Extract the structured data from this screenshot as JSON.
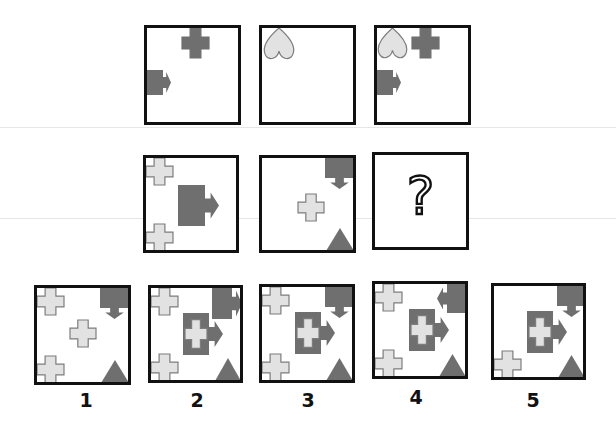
{
  "puzzle": {
    "colors": {
      "dark_fill": "#6f6f6f",
      "light_fill": "#e2e2e2",
      "light_stroke": "#7d7d7d",
      "border": "#111111"
    },
    "question_mark": "?",
    "matrix": [
      {
        "row": 1,
        "panels": [
          {
            "id": "r1c1",
            "box": [
              144,
              25,
              97,
              100
            ],
            "shapes": [
              {
                "type": "cross",
                "fill": "dark",
                "x": 35,
                "y": 0,
                "w": 27,
                "h": 30
              },
              {
                "type": "arrow-block",
                "fill": "dark",
                "dir": "right",
                "x": 0,
                "y": 42,
                "w": 16,
                "h": 25,
                "tip": 8
              }
            ]
          },
          {
            "id": "r1c2",
            "box": [
              259,
              25,
              97,
              100
            ],
            "shapes": [
              {
                "type": "heart-inverted",
                "fill": "light",
                "x": 1,
                "y": 0,
                "w": 32,
                "h": 32
              }
            ]
          },
          {
            "id": "r1c3",
            "box": [
              374,
              25,
              97,
              100
            ],
            "shapes": [
              {
                "type": "heart-inverted",
                "fill": "light",
                "x": 0,
                "y": 0,
                "w": 31,
                "h": 31
              },
              {
                "type": "cross",
                "fill": "dark",
                "x": 35,
                "y": 0,
                "w": 27,
                "h": 30
              },
              {
                "type": "arrow-block",
                "fill": "dark",
                "dir": "right",
                "x": 0,
                "y": 42,
                "w": 16,
                "h": 25,
                "tip": 8
              }
            ]
          }
        ]
      },
      {
        "row": 2,
        "panels": [
          {
            "id": "r2c1",
            "box": [
              143,
              155,
              96,
              98
            ],
            "shapes": [
              {
                "type": "cross",
                "fill": "light",
                "x": 0,
                "y": 0,
                "w": 27,
                "h": 27
              },
              {
                "type": "cross",
                "fill": "light",
                "x": 0,
                "y": 66,
                "w": 27,
                "h": 27
              },
              {
                "type": "arrow-block",
                "fill": "dark",
                "dir": "right",
                "x": 32,
                "y": 27,
                "w": 27,
                "h": 41,
                "tip": 14
              }
            ]
          },
          {
            "id": "r2c2",
            "box": [
              259,
              155,
              97,
              98
            ],
            "shapes": [
              {
                "type": "arrow-block",
                "fill": "dark",
                "dir": "down",
                "x": 63,
                "y": 0,
                "w": 29,
                "h": 20,
                "tip": 11
              },
              {
                "type": "cross",
                "fill": "light",
                "x": 36,
                "y": 36,
                "w": 26,
                "h": 27
              },
              {
                "type": "triangle",
                "fill": "dark",
                "x": 64,
                "y": 70,
                "w": 28,
                "h": 23
              }
            ]
          },
          {
            "id": "r2c3",
            "box": [
              372,
              152,
              97,
              98
            ],
            "question": true
          }
        ]
      }
    ],
    "options": [
      {
        "label": "1",
        "label_x": 86,
        "label_y": 389,
        "box": [
          34,
          285,
          97,
          100
        ],
        "shapes": [
          {
            "type": "cross",
            "fill": "light",
            "x": 0,
            "y": 0,
            "w": 27,
            "h": 27
          },
          {
            "type": "cross",
            "fill": "light",
            "x": 0,
            "y": 68,
            "w": 27,
            "h": 27
          },
          {
            "type": "cross",
            "fill": "light",
            "x": 33,
            "y": 32,
            "w": 26,
            "h": 27
          },
          {
            "type": "arrow-block",
            "fill": "dark",
            "dir": "down",
            "x": 63,
            "y": 0,
            "w": 29,
            "h": 20,
            "tip": 11
          },
          {
            "type": "triangle",
            "fill": "dark",
            "x": 64,
            "y": 72,
            "w": 28,
            "h": 23
          }
        ]
      },
      {
        "label": "2",
        "label_x": 197,
        "label_y": 389,
        "box": [
          148,
          285,
          95,
          98
        ],
        "shapes": [
          {
            "type": "cross",
            "fill": "light",
            "x": 0,
            "y": 0,
            "w": 27,
            "h": 27
          },
          {
            "type": "cross",
            "fill": "light",
            "x": 0,
            "y": 66,
            "w": 27,
            "h": 27
          },
          {
            "type": "arrow-block",
            "fill": "dark",
            "dir": "right",
            "x": 61,
            "y": 0,
            "w": 20,
            "h": 31,
            "tip": 10
          },
          {
            "type": "arrow-block",
            "fill": "dark",
            "dir": "right",
            "x": 32,
            "y": 25,
            "w": 26,
            "h": 42,
            "tip": 14,
            "inner_cross": true
          },
          {
            "type": "triangle",
            "fill": "dark",
            "x": 64,
            "y": 70,
            "w": 26,
            "h": 23
          }
        ]
      },
      {
        "label": "3",
        "label_x": 308,
        "label_y": 389,
        "box": [
          259,
          284,
          96,
          99
        ],
        "shapes": [
          {
            "type": "cross",
            "fill": "light",
            "x": 0,
            "y": 0,
            "w": 27,
            "h": 27
          },
          {
            "type": "cross",
            "fill": "light",
            "x": 0,
            "y": 67,
            "w": 27,
            "h": 27
          },
          {
            "type": "arrow-block",
            "fill": "dark",
            "dir": "down",
            "x": 63,
            "y": 0,
            "w": 29,
            "h": 20,
            "tip": 11
          },
          {
            "type": "arrow-block",
            "fill": "dark",
            "dir": "right",
            "x": 33,
            "y": 25,
            "w": 26,
            "h": 42,
            "tip": 14,
            "inner_cross": true
          },
          {
            "type": "triangle",
            "fill": "dark",
            "x": 64,
            "y": 71,
            "w": 27,
            "h": 23
          }
        ]
      },
      {
        "label": "4",
        "label_x": 416,
        "label_y": 386,
        "box": [
          372,
          281,
          96,
          98
        ],
        "shapes": [
          {
            "type": "cross",
            "fill": "light",
            "x": 0,
            "y": 0,
            "w": 27,
            "h": 27
          },
          {
            "type": "cross",
            "fill": "light",
            "x": 0,
            "y": 66,
            "w": 27,
            "h": 27
          },
          {
            "type": "arrow-block",
            "fill": "dark",
            "dir": "left",
            "x": 72,
            "y": 0,
            "w": 19,
            "h": 29,
            "tip": 10
          },
          {
            "type": "arrow-block",
            "fill": "dark",
            "dir": "right",
            "x": 34,
            "y": 25,
            "w": 26,
            "h": 42,
            "tip": 14,
            "inner_cross": true
          },
          {
            "type": "triangle",
            "fill": "dark",
            "x": 64,
            "y": 70,
            "w": 27,
            "h": 23
          }
        ]
      },
      {
        "label": "5",
        "label_x": 533,
        "label_y": 389,
        "box": [
          491,
          283,
          95,
          97
        ],
        "shapes": [
          {
            "type": "cross",
            "fill": "light",
            "x": 0,
            "y": 65,
            "w": 27,
            "h": 27
          },
          {
            "type": "arrow-block",
            "fill": "dark",
            "dir": "down",
            "x": 63,
            "y": 0,
            "w": 29,
            "h": 20,
            "tip": 11
          },
          {
            "type": "arrow-block",
            "fill": "dark",
            "dir": "right",
            "x": 33,
            "y": 25,
            "w": 26,
            "h": 42,
            "tip": 14,
            "inner_cross": true
          },
          {
            "type": "triangle",
            "fill": "dark",
            "x": 64,
            "y": 69,
            "w": 27,
            "h": 23
          }
        ]
      }
    ]
  }
}
